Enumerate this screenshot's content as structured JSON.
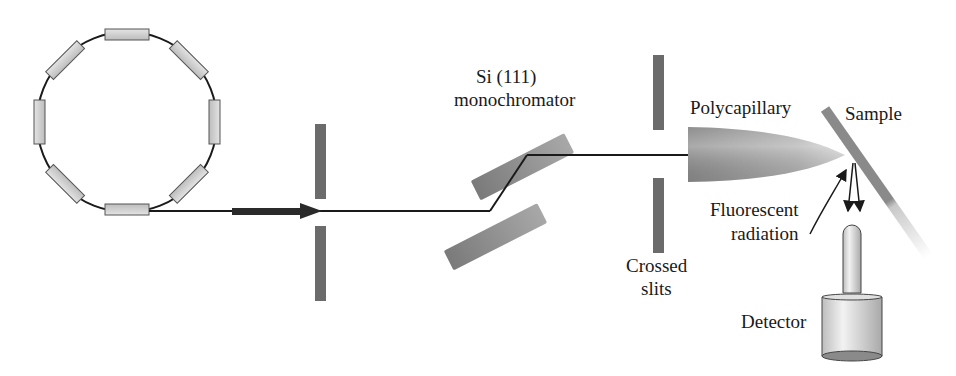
{
  "diagram": {
    "type": "synchrotron-xrf-beamline",
    "labels": {
      "monochromator_line1": "Si (111)",
      "monochromator_line2": "monochromator",
      "polycapillary": "Polycapillary",
      "sample": "Sample",
      "fluorescent_line1": "Fluorescent",
      "fluorescent_line2": "radiation",
      "slits_line1": "Crossed",
      "slits_line2": "slits",
      "detector": "Detector"
    },
    "components": [
      "storage-ring",
      "beam-arrow",
      "aperture-slits",
      "si-111-double-crystal-monochromator",
      "crossed-slits",
      "polycapillary-optic",
      "sample",
      "detector"
    ],
    "colors": {
      "line": "#1a1a1a",
      "slit": "#6b6b6b",
      "crystal": "#8c8c8c",
      "magnet": "#c8c8c8",
      "beam_arrow": "#2a2a2a"
    }
  }
}
